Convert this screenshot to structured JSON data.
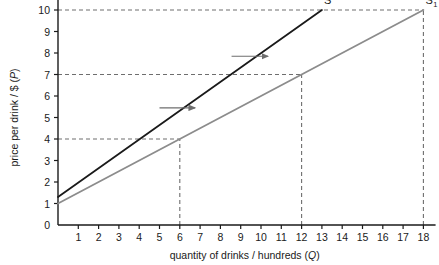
{
  "chart_data": {
    "type": "line",
    "title": "",
    "xlabel": "quantity of drinks / hundreds (Q)",
    "ylabel": "price per drink / $ (P)",
    "xlim": [
      0,
      18.6
    ],
    "ylim": [
      0,
      10.4
    ],
    "xticks": [
      1,
      2,
      3,
      4,
      5,
      6,
      7,
      8,
      9,
      10,
      11,
      12,
      13,
      14,
      15,
      16,
      17,
      18
    ],
    "yticks": [
      0,
      1,
      2,
      3,
      4,
      5,
      6,
      7,
      8,
      9,
      10
    ],
    "grid": false,
    "legend": "inline-end-labels",
    "series": [
      {
        "name": "S",
        "label": "S",
        "sublabel": "",
        "color": "#1a1a1a",
        "x": [
          0,
          13
        ],
        "y": [
          1.3,
          10.0
        ],
        "note": "original supply curve, intercept P=1.3 at Q=0, reaches P=10 at Q=13"
      },
      {
        "name": "S1",
        "label": "S",
        "sublabel": "1",
        "color": "#8c8c8c",
        "x": [
          0,
          18
        ],
        "y": [
          1.0,
          10.0
        ],
        "note": "shifted supply curve, intercept P=1.0 at Q=0, reaches P=10 at Q=18"
      }
    ],
    "guide_lines": [
      {
        "name": "p10-horizontal",
        "type": "horizontal",
        "value": 10,
        "from_x": 0,
        "to_x": 18,
        "style": "dashed"
      },
      {
        "name": "p7-horizontal",
        "type": "horizontal",
        "value": 7,
        "from_x": 0,
        "to_x": 12,
        "style": "dashed"
      },
      {
        "name": "p4-horizontal",
        "type": "horizontal",
        "value": 4,
        "from_x": 0,
        "to_x": 6,
        "style": "dashed"
      },
      {
        "name": "q6-vertical",
        "type": "vertical",
        "value": 6,
        "from_y": 0,
        "to_y": 4,
        "style": "dashed"
      },
      {
        "name": "q12-vertical",
        "type": "vertical",
        "value": 12,
        "from_y": 0,
        "to_y": 7,
        "style": "dashed"
      },
      {
        "name": "q18-vertical",
        "type": "vertical",
        "value": 18,
        "from_y": 0,
        "to_y": 10,
        "style": "dashed"
      }
    ],
    "annotations": [
      {
        "name": "shift-arrow-upper",
        "type": "arrow",
        "direction": "right",
        "from": [
          8.55,
          7.85
        ],
        "to": [
          10.35,
          7.85
        ]
      },
      {
        "name": "shift-arrow-lower",
        "type": "arrow",
        "direction": "right",
        "from": [
          5.0,
          5.45
        ],
        "to": [
          6.75,
          5.45
        ]
      }
    ]
  },
  "colors": {
    "background": "#ffffff",
    "axis": "#1a1a1a",
    "text": "#1a1a1a",
    "series_s": "#1a1a1a",
    "series_s1": "#8c8c8c",
    "guide_dash": "#6e6e6e",
    "arrow": "#6e6e6e"
  }
}
